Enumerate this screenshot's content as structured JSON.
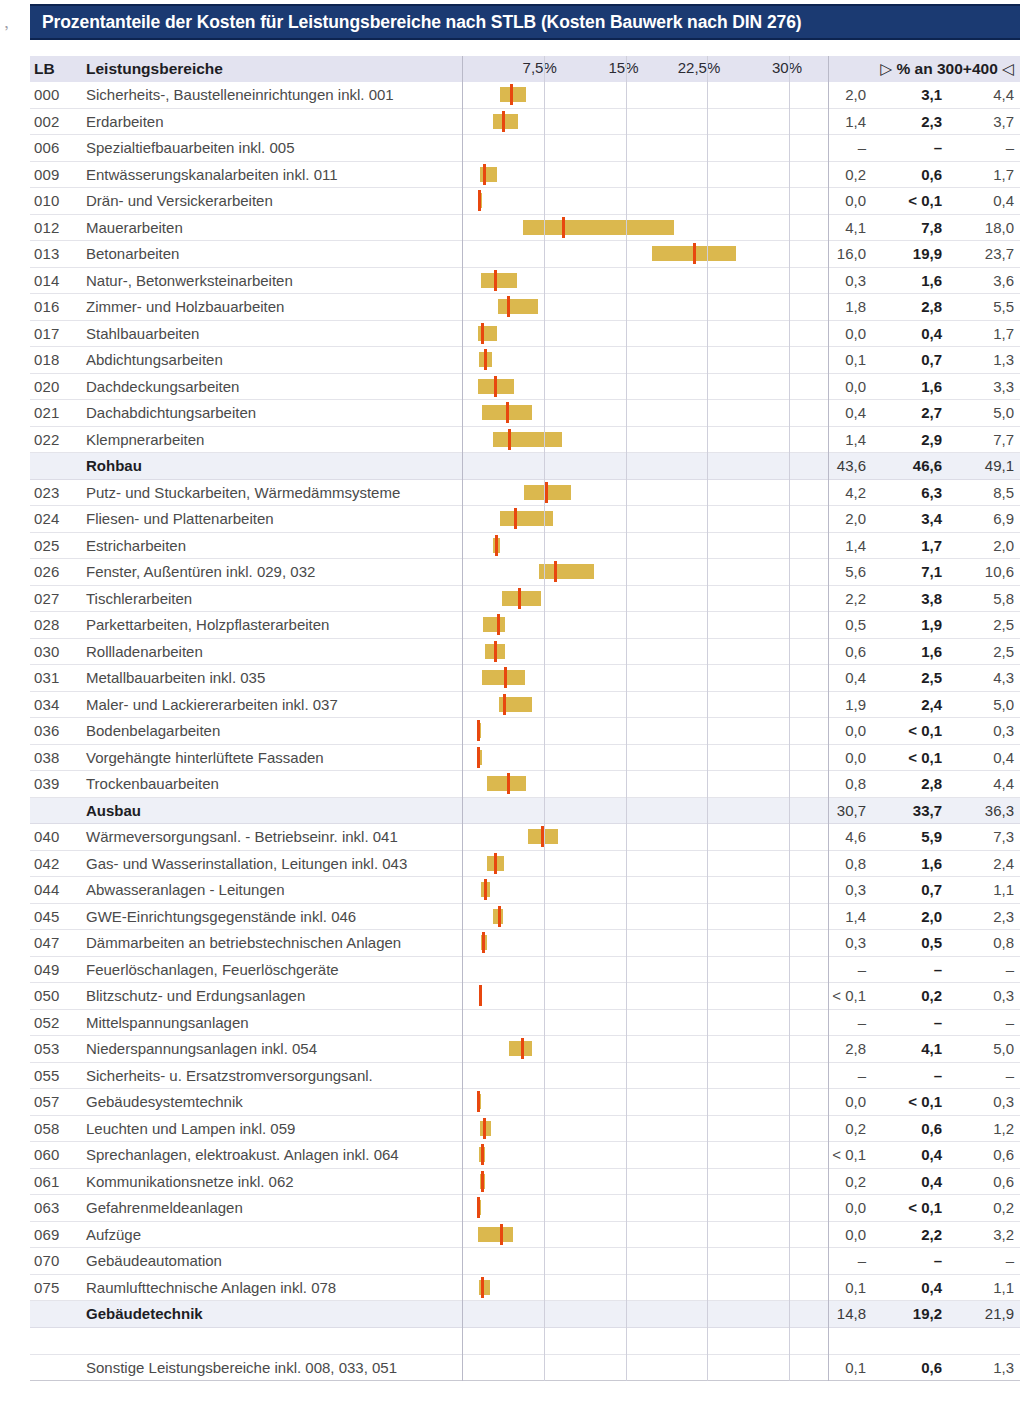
{
  "title": "Prozentanteile der Kosten für Leistungsbereiche nach STLB (Kosten Bauwerk nach DIN 276)",
  "scan_mark": ",",
  "header": {
    "lb": "LB",
    "name": "Leistungsbereiche",
    "right_marker_left": "▷",
    "right_label": "% an 300+400",
    "right_marker_right": "◁"
  },
  "chart_data": {
    "type": "bar",
    "title": "Prozentanteile der Kosten für Leistungsbereiche nach STLB (Kosten Bauwerk nach DIN 276)",
    "xlabel": "% an 300+400",
    "ylabel": "Leistungsbereiche",
    "xlim": [
      0,
      33
    ],
    "grid": true,
    "axis_ticks": [
      {
        "label": "7,5%",
        "value": 7.5
      },
      {
        "label": "15%",
        "value": 15
      },
      {
        "label": "22,5%",
        "value": 22.5
      },
      {
        "label": "30%",
        "value": 30
      }
    ],
    "columns": [
      "LB",
      "Leistungsbereiche",
      "min",
      "median",
      "max"
    ],
    "note": "Horizontal range bars span min..max; red tick marks the median value.",
    "rows": [
      {
        "lb": "000",
        "name": "Sicherheits-, Baustelleneinrichtungen inkl. 001",
        "min": "2,0",
        "mid": "3,1",
        "max": "4,4",
        "bar": [
          2.0,
          4.4
        ],
        "median": 3.1,
        "type": "item"
      },
      {
        "lb": "002",
        "name": "Erdarbeiten",
        "min": "1,4",
        "mid": "2,3",
        "max": "3,7",
        "bar": [
          1.4,
          3.7
        ],
        "median": 2.3,
        "type": "item"
      },
      {
        "lb": "006",
        "name": "Spezialtiefbauarbeiten inkl. 005",
        "min": "–",
        "mid": "–",
        "max": "–",
        "bar": null,
        "median": null,
        "type": "item"
      },
      {
        "lb": "009",
        "name": "Entwässerungskanalarbeiten inkl. 011",
        "min": "0,2",
        "mid": "0,6",
        "max": "1,7",
        "bar": [
          0.2,
          1.7
        ],
        "median": 0.6,
        "type": "item"
      },
      {
        "lb": "010",
        "name": "Drän- und Versickerarbeiten",
        "min": "0,0",
        "mid": "< 0,1",
        "max": "0,4",
        "bar": [
          0.0,
          0.4
        ],
        "median": 0.1,
        "type": "item"
      },
      {
        "lb": "012",
        "name": "Mauerarbeiten",
        "min": "4,1",
        "mid": "7,8",
        "max": "18,0",
        "bar": [
          4.1,
          18.0
        ],
        "median": 7.8,
        "type": "item"
      },
      {
        "lb": "013",
        "name": "Betonarbeiten",
        "min": "16,0",
        "mid": "19,9",
        "max": "23,7",
        "bar": [
          16.0,
          23.7
        ],
        "median": 19.9,
        "type": "item"
      },
      {
        "lb": "014",
        "name": "Natur-, Betonwerksteinarbeiten",
        "min": "0,3",
        "mid": "1,6",
        "max": "3,6",
        "bar": [
          0.3,
          3.6
        ],
        "median": 1.6,
        "type": "item"
      },
      {
        "lb": "016",
        "name": "Zimmer- und Holzbauarbeiten",
        "min": "1,8",
        "mid": "2,8",
        "max": "5,5",
        "bar": [
          1.8,
          5.5
        ],
        "median": 2.8,
        "type": "item"
      },
      {
        "lb": "017",
        "name": "Stahlbauarbeiten",
        "min": "0,0",
        "mid": "0,4",
        "max": "1,7",
        "bar": [
          0.0,
          1.7
        ],
        "median": 0.4,
        "type": "item"
      },
      {
        "lb": "018",
        "name": "Abdichtungsarbeiten",
        "min": "0,1",
        "mid": "0,7",
        "max": "1,3",
        "bar": [
          0.1,
          1.3
        ],
        "median": 0.7,
        "type": "item"
      },
      {
        "lb": "020",
        "name": "Dachdeckungsarbeiten",
        "min": "0,0",
        "mid": "1,6",
        "max": "3,3",
        "bar": [
          0.0,
          3.3
        ],
        "median": 1.6,
        "type": "item"
      },
      {
        "lb": "021",
        "name": "Dachabdichtungsarbeiten",
        "min": "0,4",
        "mid": "2,7",
        "max": "5,0",
        "bar": [
          0.4,
          5.0
        ],
        "median": 2.7,
        "type": "item"
      },
      {
        "lb": "022",
        "name": "Klempnerarbeiten",
        "min": "1,4",
        "mid": "2,9",
        "max": "7,7",
        "bar": [
          1.4,
          7.7
        ],
        "median": 2.9,
        "type": "item"
      },
      {
        "lb": "",
        "name": "Rohbau",
        "min": "43,6",
        "mid": "46,6",
        "max": "49,1",
        "bar": null,
        "median": null,
        "type": "group"
      },
      {
        "lb": "023",
        "name": "Putz- und Stuckarbeiten, Wärmedämmsysteme",
        "min": "4,2",
        "mid": "6,3",
        "max": "8,5",
        "bar": [
          4.2,
          8.5
        ],
        "median": 6.3,
        "type": "item"
      },
      {
        "lb": "024",
        "name": "Fliesen- und Plattenarbeiten",
        "min": "2,0",
        "mid": "3,4",
        "max": "6,9",
        "bar": [
          2.0,
          6.9
        ],
        "median": 3.4,
        "type": "item"
      },
      {
        "lb": "025",
        "name": "Estricharbeiten",
        "min": "1,4",
        "mid": "1,7",
        "max": "2,0",
        "bar": [
          1.4,
          2.0
        ],
        "median": 1.7,
        "type": "item"
      },
      {
        "lb": "026",
        "name": "Fenster, Außentüren inkl. 029, 032",
        "min": "5,6",
        "mid": "7,1",
        "max": "10,6",
        "bar": [
          5.6,
          10.6
        ],
        "median": 7.1,
        "type": "item"
      },
      {
        "lb": "027",
        "name": "Tischlerarbeiten",
        "min": "2,2",
        "mid": "3,8",
        "max": "5,8",
        "bar": [
          2.2,
          5.8
        ],
        "median": 3.8,
        "type": "item"
      },
      {
        "lb": "028",
        "name": "Parkettarbeiten, Holzpflasterarbeiten",
        "min": "0,5",
        "mid": "1,9",
        "max": "2,5",
        "bar": [
          0.5,
          2.5
        ],
        "median": 1.9,
        "type": "item"
      },
      {
        "lb": "030",
        "name": "Rollladenarbeiten",
        "min": "0,6",
        "mid": "1,6",
        "max": "2,5",
        "bar": [
          0.6,
          2.5
        ],
        "median": 1.6,
        "type": "item"
      },
      {
        "lb": "031",
        "name": "Metallbauarbeiten inkl. 035",
        "min": "0,4",
        "mid": "2,5",
        "max": "4,3",
        "bar": [
          0.4,
          4.3
        ],
        "median": 2.5,
        "type": "item"
      },
      {
        "lb": "034",
        "name": "Maler- und Lackiererarbeiten inkl. 037",
        "min": "1,9",
        "mid": "2,4",
        "max": "5,0",
        "bar": [
          1.9,
          5.0
        ],
        "median": 2.4,
        "type": "item"
      },
      {
        "lb": "036",
        "name": "Bodenbelagarbeiten",
        "min": "0,0",
        "mid": "< 0,1",
        "max": "0,3",
        "bar": [
          0.0,
          0.3
        ],
        "median": 0.08,
        "type": "item"
      },
      {
        "lb": "038",
        "name": "Vorgehängte hinterlüftete Fassaden",
        "min": "0,0",
        "mid": "< 0,1",
        "max": "0,4",
        "bar": [
          0.0,
          0.4
        ],
        "median": 0.08,
        "type": "item"
      },
      {
        "lb": "039",
        "name": "Trockenbauarbeiten",
        "min": "0,8",
        "mid": "2,8",
        "max": "4,4",
        "bar": [
          0.8,
          4.4
        ],
        "median": 2.8,
        "type": "item"
      },
      {
        "lb": "",
        "name": "Ausbau",
        "min": "30,7",
        "mid": "33,7",
        "max": "36,3",
        "bar": null,
        "median": null,
        "type": "group"
      },
      {
        "lb": "040",
        "name": "Wärmeversorgungsanl. - Betriebseinr. inkl. 041",
        "min": "4,6",
        "mid": "5,9",
        "max": "7,3",
        "bar": [
          4.6,
          7.3
        ],
        "median": 5.9,
        "type": "item"
      },
      {
        "lb": "042",
        "name": "Gas- und Wasserinstallation, Leitungen inkl. 043",
        "min": "0,8",
        "mid": "1,6",
        "max": "2,4",
        "bar": [
          0.8,
          2.4
        ],
        "median": 1.6,
        "type": "item"
      },
      {
        "lb": "044",
        "name": "Abwasseranlagen - Leitungen",
        "min": "0,3",
        "mid": "0,7",
        "max": "1,1",
        "bar": [
          0.3,
          1.1
        ],
        "median": 0.7,
        "type": "item"
      },
      {
        "lb": "045",
        "name": "GWE-Einrichtungsgegenstände inkl. 046",
        "min": "1,4",
        "mid": "2,0",
        "max": "2,3",
        "bar": [
          1.4,
          2.3
        ],
        "median": 2.0,
        "type": "item"
      },
      {
        "lb": "047",
        "name": "Dämmarbeiten an betriebstechnischen Anlagen",
        "min": "0,3",
        "mid": "0,5",
        "max": "0,8",
        "bar": [
          0.3,
          0.8
        ],
        "median": 0.5,
        "type": "item"
      },
      {
        "lb": "049",
        "name": "Feuerlöschanlagen, Feuerlöschgeräte",
        "min": "–",
        "mid": "–",
        "max": "–",
        "bar": null,
        "median": null,
        "type": "item"
      },
      {
        "lb": "050",
        "name": "Blitzschutz- und Erdungsanlagen",
        "min": "< 0,1",
        "mid": "0,2",
        "max": "0,3",
        "bar": [
          0.05,
          0.3
        ],
        "median": 0.2,
        "type": "item"
      },
      {
        "lb": "052",
        "name": "Mittelspannungsanlagen",
        "min": "–",
        "mid": "–",
        "max": "–",
        "bar": null,
        "median": null,
        "type": "item"
      },
      {
        "lb": "053",
        "name": "Niederspannungsanlagen inkl. 054",
        "min": "2,8",
        "mid": "4,1",
        "max": "5,0",
        "bar": [
          2.8,
          5.0
        ],
        "median": 4.1,
        "type": "item"
      },
      {
        "lb": "055",
        "name": "Sicherheits- u. Ersatzstromversorgungsanl.",
        "min": "–",
        "mid": "–",
        "max": "–",
        "bar": null,
        "median": null,
        "type": "item"
      },
      {
        "lb": "057",
        "name": "Gebäudesystemtechnik",
        "min": "0,0",
        "mid": "< 0,1",
        "max": "0,3",
        "bar": [
          0.0,
          0.3
        ],
        "median": 0.08,
        "type": "item"
      },
      {
        "lb": "058",
        "name": "Leuchten und Lampen inkl. 059",
        "min": "0,2",
        "mid": "0,6",
        "max": "1,2",
        "bar": [
          0.2,
          1.2
        ],
        "median": 0.6,
        "type": "item"
      },
      {
        "lb": "060",
        "name": "Sprechanlagen, elektroakust. Anlagen inkl. 064",
        "min": "< 0,1",
        "mid": "0,4",
        "max": "0,6",
        "bar": [
          0.05,
          0.6
        ],
        "median": 0.4,
        "type": "item"
      },
      {
        "lb": "061",
        "name": "Kommunikationsnetze inkl. 062",
        "min": "0,2",
        "mid": "0,4",
        "max": "0,6",
        "bar": [
          0.2,
          0.6
        ],
        "median": 0.4,
        "type": "item"
      },
      {
        "lb": "063",
        "name": "Gefahrenmeldeanlagen",
        "min": "0,0",
        "mid": "< 0,1",
        "max": "0,2",
        "bar": [
          0.0,
          0.2
        ],
        "median": 0.07,
        "type": "item"
      },
      {
        "lb": "069",
        "name": "Aufzüge",
        "min": "0,0",
        "mid": "2,2",
        "max": "3,2",
        "bar": [
          0.0,
          3.2
        ],
        "median": 2.2,
        "type": "item"
      },
      {
        "lb": "070",
        "name": "Gebäudeautomation",
        "min": "–",
        "mid": "–",
        "max": "–",
        "bar": null,
        "median": null,
        "type": "item"
      },
      {
        "lb": "075",
        "name": "Raumlufttechnische Anlagen inkl. 078",
        "min": "0,1",
        "mid": "0,4",
        "max": "1,1",
        "bar": [
          0.1,
          1.1
        ],
        "median": 0.4,
        "type": "item"
      },
      {
        "lb": "",
        "name": "Gebäudetechnik",
        "min": "14,8",
        "mid": "19,2",
        "max": "21,9",
        "bar": null,
        "median": null,
        "type": "group"
      },
      {
        "lb": "",
        "name": "",
        "min": "",
        "mid": "",
        "max": "",
        "bar": null,
        "median": null,
        "type": "spacer"
      },
      {
        "lb": "",
        "name": "Sonstige Leistungsbereiche inkl. 008, 033, 051",
        "min": "0,1",
        "mid": "0,6",
        "max": "1,3",
        "bar": null,
        "median": null,
        "type": "item"
      }
    ]
  },
  "colors": {
    "title_bar": "#1b3a72",
    "bar_fill": "#d8b23f",
    "median_mark": "#e8470f",
    "header_band": "#e3e3f0",
    "group_band": "#eef0f7"
  }
}
